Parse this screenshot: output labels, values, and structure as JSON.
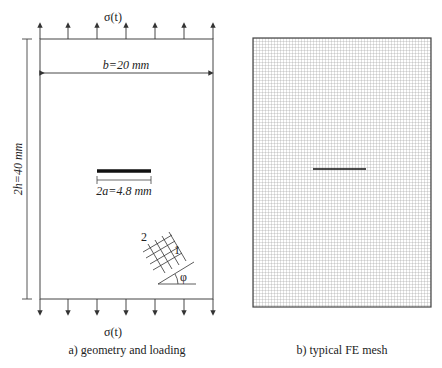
{
  "panel_a": {
    "caption": "a) geometry and loading",
    "load_top": "σ(t)",
    "load_bottom": "σ(t)",
    "width_label": "b=20 mm",
    "height_label": "2h=40 mm",
    "crack_label": "2a=4.8 mm",
    "axis_1": "1",
    "axis_2": "2",
    "angle_label": "φ"
  },
  "panel_b": {
    "caption": "b) typical FE mesh"
  },
  "colors": {
    "line": "#333333",
    "mesh": "#9a9a9a",
    "crack": "#111111"
  }
}
